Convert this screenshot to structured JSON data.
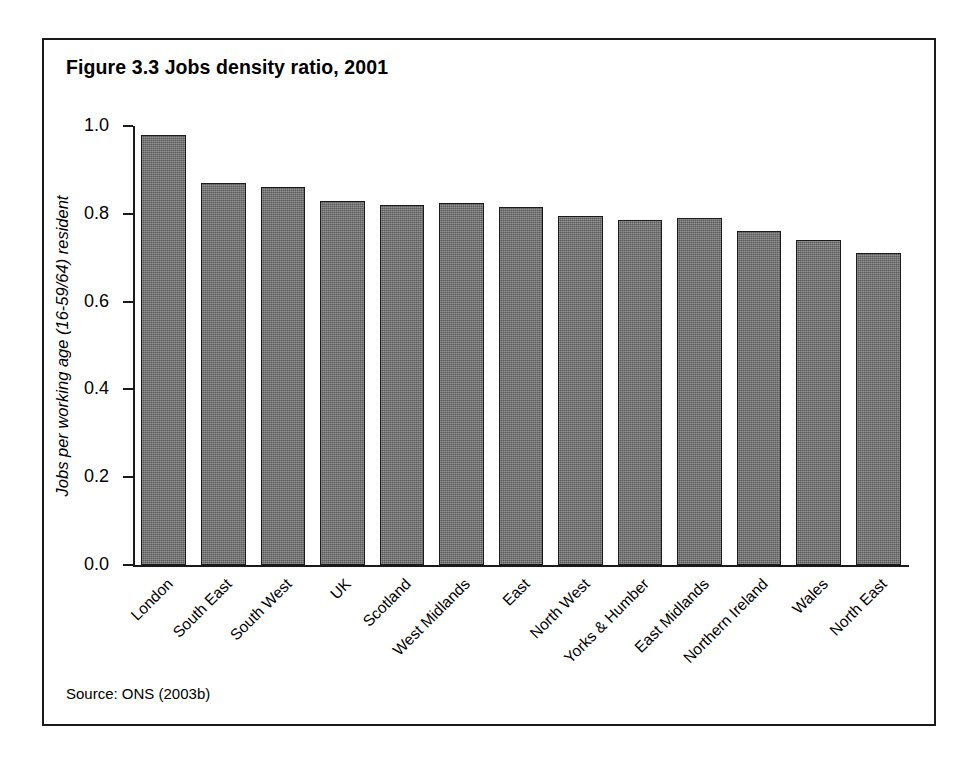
{
  "figure": {
    "title": "Figure 3.3 Jobs density ratio, 2001",
    "source": "Source: ONS (2003b)",
    "frame_color": "#1a1a1a",
    "bar_color": "#6f6f6f",
    "bar_border_color": "#1b1b1b",
    "background": "#ffffff"
  },
  "chart_data": {
    "type": "bar",
    "title": "Figure 3.3 Jobs density ratio, 2001",
    "xlabel": "",
    "ylabel": "Jobs per working age (16-59/64) resident",
    "ylim": [
      0.0,
      1.0
    ],
    "ytick_labels": [
      "0.0",
      "0.2",
      "0.4",
      "0.6",
      "0.8",
      "1.0"
    ],
    "yticks": [
      0.0,
      0.2,
      0.4,
      0.6,
      0.8,
      1.0
    ],
    "grid": false,
    "legend": false,
    "categories": [
      "London",
      "South East",
      "South West",
      "UK",
      "Scotland",
      "West Midlands",
      "East",
      "North West",
      "Yorks & Humber",
      "East Midlands",
      "Northern Ireland",
      "Wales",
      "North East"
    ],
    "values": [
      0.98,
      0.87,
      0.86,
      0.83,
      0.82,
      0.825,
      0.815,
      0.795,
      0.785,
      0.79,
      0.76,
      0.74,
      0.71
    ],
    "source": "Source: ONS (2003b)"
  }
}
